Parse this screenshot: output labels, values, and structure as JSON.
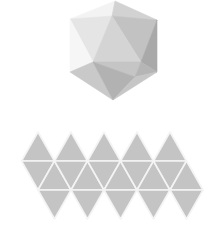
{
  "figure": {
    "colors": {
      "background": "#ffffff",
      "net_fill": "#c4c4c4",
      "net_edge": "#f4f4f4"
    }
  },
  "icosahedron": {
    "faces": [
      {
        "points": "115,1 70,19 112,16",
        "fill": "#f3f3f3"
      },
      {
        "points": "115,1 112,16 157,20",
        "fill": "#d2d2d2"
      },
      {
        "points": "70,19 112,16 93,62",
        "fill": "#e5e5e5"
      },
      {
        "points": "112,16 157,20 141,62",
        "fill": "#c2c2c2"
      },
      {
        "points": "112,16 93,62 141,62",
        "fill": "#d4d4d4"
      },
      {
        "points": "157,20 157,72 141,62",
        "fill": "#a9a9a9"
      },
      {
        "points": "70,19 70,72 93,62",
        "fill": "#f6f6f6"
      },
      {
        "points": "93,62 141,62 135,77",
        "fill": "#c5c5c5"
      },
      {
        "points": "141,62 157,72 135,77",
        "fill": "#b5b5b5"
      },
      {
        "points": "70,72 93,62 113,100",
        "fill": "#c9c9c9"
      },
      {
        "points": "93,62 135,77 113,100",
        "fill": "#b2b2b2"
      },
      {
        "points": "135,77 157,72 113,100",
        "fill": "#c6c6c6"
      }
    ]
  },
  "net": {
    "triangle_width": 33,
    "row_y": [
      132,
      161,
      190,
      219
    ],
    "top_row_apex_x": [
      38,
      71,
      104,
      137,
      170
    ],
    "bottom_row_apex_x": [
      54.5,
      87.5,
      120.5,
      153.5,
      186.5
    ],
    "face_count": 20
  }
}
